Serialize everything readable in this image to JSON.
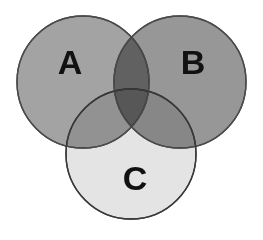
{
  "figure": {
    "type": "venn-diagram",
    "background_color": "#ffffff",
    "width": 263,
    "height": 240,
    "set_count": 3
  },
  "chart_data": {
    "type": "venn",
    "title": "",
    "subtitle": "",
    "xlabel": "",
    "ylabel": "",
    "grid": false,
    "legend": "none",
    "sets": [
      {
        "label": "A",
        "position": "upper-left",
        "fill_color": "#a3a3a3",
        "stroke_color": "#4a4a4a",
        "cx": 83,
        "cy": 82,
        "r": 66,
        "label_x": 70,
        "label_y": 62
      },
      {
        "label": "B",
        "position": "upper-right",
        "fill_color": "#979797",
        "stroke_color": "#4a4a4a",
        "cx": 180,
        "cy": 82,
        "r": 66,
        "label_x": 193,
        "label_y": 62
      },
      {
        "label": "C",
        "position": "bottom-center",
        "fill_color": "#e4e4e4",
        "stroke_color": "#3a3a3a",
        "cx": 131,
        "cy": 154,
        "r": 65,
        "label_x": 135,
        "label_y": 178
      }
    ],
    "regions": [
      {
        "name": "A only",
        "members": [
          "A"
        ],
        "observed_color": "#a3a3a3"
      },
      {
        "name": "B only",
        "members": [
          "B"
        ],
        "observed_color": "#979797"
      },
      {
        "name": "C only",
        "members": [
          "C"
        ],
        "observed_color": "#e8e8e8"
      },
      {
        "name": "A and B",
        "members": [
          "A",
          "B"
        ],
        "observed_color": "#7b7b7b"
      },
      {
        "name": "A and C",
        "members": [
          "A",
          "C"
        ],
        "observed_color": "#a8a8a8"
      },
      {
        "name": "B and C",
        "members": [
          "B",
          "C"
        ],
        "observed_color": "#c6c6c6"
      },
      {
        "name": "A and B and C",
        "members": [
          "A",
          "B",
          "C"
        ],
        "observed_color": "#b4b4b4"
      }
    ],
    "stroke_width": 1.4,
    "label_font_size": 34,
    "label_color": "#111111"
  },
  "labels": {
    "set_a": "A",
    "set_b": "B",
    "set_c": "C"
  }
}
